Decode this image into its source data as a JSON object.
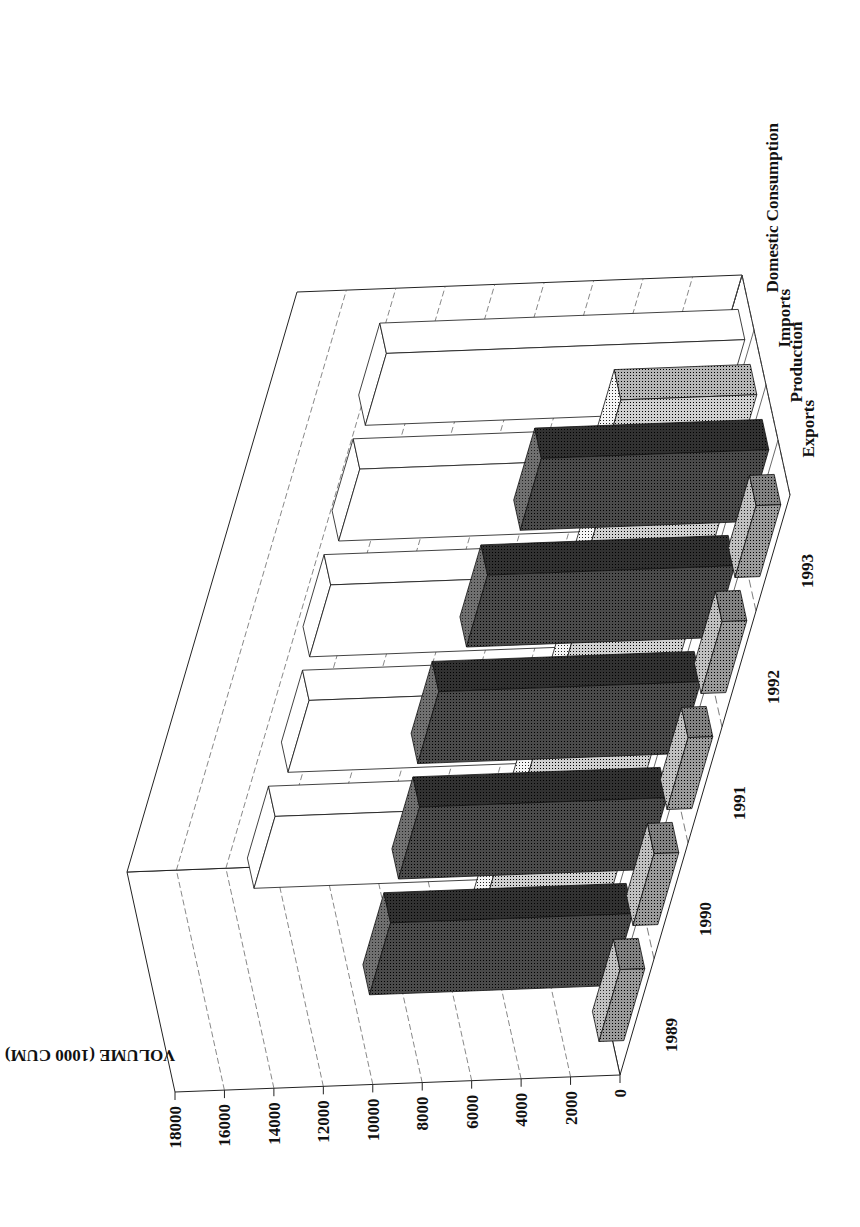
{
  "chart_data": {
    "type": "bar",
    "subtype": "3d-grouped-bar (rotated 90°)",
    "title": "",
    "ylabel": "VOLUME (1000 CUM)",
    "xlabel": "",
    "categories": [
      "1989",
      "1990",
      "1991",
      "1992",
      "1993"
    ],
    "series": [
      {
        "name": "Exports",
        "values": [
          1000,
          1000,
          1000,
          1000,
          1000
        ],
        "color": "#9a9a9a"
      },
      {
        "name": "Production",
        "values": [
          9800,
          10000,
          10600,
          10000,
          9200
        ],
        "color": "#4a4a4a"
      },
      {
        "name": "Imports",
        "values": [
          5000,
          4800,
          4600,
          5000,
          5500
        ],
        "color": "#cfcfcf"
      },
      {
        "name": "Domestic Consumption",
        "values": [
          13500,
          13500,
          14000,
          14200,
          14500
        ],
        "color": "#ffffff"
      }
    ],
    "yticks": [
      "0",
      "2000",
      "4000",
      "6000",
      "8000",
      "10000",
      "12000",
      "14000",
      "16000",
      "18000"
    ],
    "ylim": [
      0,
      18000
    ],
    "grid": true,
    "legend_position": "depth-axis labels"
  }
}
